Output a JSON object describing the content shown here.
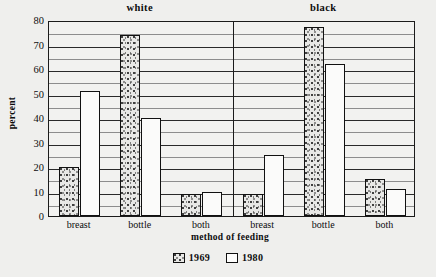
{
  "chart_data": {
    "type": "bar",
    "title": "",
    "xlabel": "method of feeding",
    "ylabel": "percent",
    "ylim": [
      0,
      80
    ],
    "yticks": [
      0,
      10,
      20,
      30,
      40,
      50,
      60,
      70,
      80
    ],
    "minor_gridline_step": 5,
    "grid": true,
    "legend_position": "bottom-center",
    "panels": [
      {
        "name": "white",
        "categories": [
          "breast",
          "bottle",
          "both"
        ],
        "series": [
          {
            "name": "1969",
            "values": [
              20,
              74,
              9
            ]
          },
          {
            "name": "1980",
            "values": [
              51,
              40,
              10
            ]
          }
        ]
      },
      {
        "name": "black",
        "categories": [
          "breast",
          "bottle",
          "both"
        ],
        "series": [
          {
            "name": "1969",
            "values": [
              9,
              77,
              15
            ]
          },
          {
            "name": "1980",
            "values": [
              25,
              62,
              11
            ]
          }
        ]
      }
    ],
    "series_names": [
      "1969",
      "1980"
    ],
    "categories": [
      "breast",
      "bottle",
      "both",
      "breast",
      "bottle",
      "both"
    ]
  },
  "legend": {
    "items": [
      {
        "label": "1969",
        "swatch": "stippled-swatch"
      },
      {
        "label": "1980",
        "swatch": "white-swatch"
      }
    ]
  },
  "colors": {
    "background": "#efefed",
    "plot_background": "#f2f2f0",
    "axis": "#1b1b1b",
    "gridline_major": "#2a2a2a",
    "gridline_minor": "#8d8d8d",
    "bar_1969": "#e8e8e6",
    "bar_1980": "#fbfbfa",
    "text": "#0d0d0d"
  }
}
